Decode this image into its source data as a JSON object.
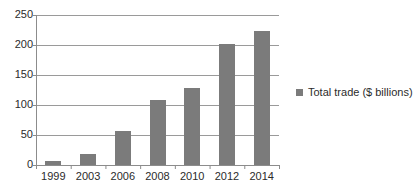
{
  "chart_data": {
    "type": "bar",
    "title": "",
    "xlabel": "",
    "ylabel": "",
    "categories": [
      "1999",
      "2003",
      "2006",
      "2008",
      "2010",
      "2012",
      "2014"
    ],
    "values": [
      6,
      19,
      56,
      108,
      128,
      201,
      224
    ],
    "series": [
      {
        "name": "Total trade ($ billions)",
        "values": [
          6,
          19,
          56,
          108,
          128,
          201,
          224
        ]
      }
    ],
    "ylim": [
      0,
      250
    ],
    "yticks": [
      0,
      50,
      100,
      150,
      200,
      250
    ],
    "ytick_labels": [
      "0",
      "50",
      "100",
      "150",
      "200",
      "250"
    ],
    "grid": "horizontal",
    "legend_position": "right",
    "legend_entries": [
      "Total trade ($ billions)"
    ],
    "colors": {
      "bar": "#7b7b7b",
      "grid": "#9a9a9a",
      "axis": "#8c8c8c",
      "text": "#2b2b2b",
      "background": "#ffffff"
    }
  },
  "legend": {
    "label": "Total trade ($ billions)",
    "marker": "square-marker"
  }
}
